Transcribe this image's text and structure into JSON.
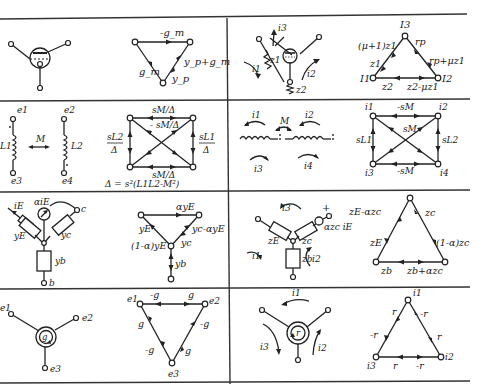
{
  "table": {
    "rows": 4,
    "columns": 2,
    "cells": [
      {
        "id": "r1c1",
        "element": "vacuum tube (triode)",
        "graph_labels": {
          "top": "-g_m",
          "right": "y_p+g_m",
          "right_lower": "y_p",
          "left": "g_m"
        }
      },
      {
        "id": "r1c2",
        "element": "vacuum tube with impedances",
        "circuit_labels": {
          "i3": "i3",
          "i1": "i1",
          "i2": "i2",
          "z1": "z1",
          "z2": "z2"
        },
        "graph_labels": {
          "top_node": "I3",
          "left_node": "I1",
          "right_node": "I2",
          "left_upper": "(μ+1)z1",
          "left_lower": "z1",
          "right_upper": "rp",
          "right_lower": "rp+μz1",
          "bottom_left": "z2",
          "bottom_right": "z2-μz1"
        }
      },
      {
        "id": "r2c1",
        "element": "coupled inductors (nodal)",
        "circuit_labels": {
          "e1": "e1",
          "e2": "e2",
          "e3": "e3",
          "e4": "e4",
          "L1": "L1",
          "L2": "L2",
          "M": "M"
        },
        "graph_labels": {
          "top": "sM/Δ",
          "center": "sM/Δ",
          "bottom": "sM/Δ",
          "left_num": "sL2",
          "left_den": "Δ",
          "right_num": "sL1",
          "right_den": "Δ",
          "center_sign": "-",
          "formula": "Δ = s²(L1L2-M²)"
        }
      },
      {
        "id": "r2c2",
        "element": "coupled inductors (mesh)",
        "circuit_labels": {
          "i1": "i1",
          "i2": "i2",
          "i3": "i3",
          "i4": "i4",
          "M": "M"
        },
        "graph_labels": {
          "n1": "i1",
          "n2": "i2",
          "n3": "i3",
          "n4": "i4",
          "top": "-sM",
          "center": "sM",
          "bottom": "-sM",
          "left": "sL1",
          "right": "sL2"
        }
      },
      {
        "id": "r3c1",
        "element": "transistor (admittance model)",
        "circuit_labels": {
          "iE": "iE",
          "source": "αiE",
          "c": "c",
          "b": "b",
          "yE": "yE",
          "yc": "yc",
          "yb": "yb"
        },
        "graph_labels": {
          "top": "αyE",
          "left": "yE",
          "left_lower": "(1-α)yE",
          "right_upper": "yc-αyE",
          "right_lower": "yc",
          "vertical": "yb"
        }
      },
      {
        "id": "r3c2",
        "element": "transistor (impedance model)",
        "circuit_labels": {
          "i1": "i1",
          "i2": "i2",
          "i3": "i3",
          "zE": "zE",
          "zc": "zc",
          "zb": "zb",
          "source": "αzc iE",
          "plus": "+"
        },
        "graph_labels": {
          "left_upper": "zE-αzc",
          "left_lower": "zE",
          "right_upper": "zc",
          "right_lower": "(1-α)zc",
          "bottom_left": "zb",
          "bottom_right": "zb+αzc"
        }
      },
      {
        "id": "r4c1",
        "element": "gyrator (conductance)",
        "circuit_labels": {
          "e1": "e1",
          "e2": "e2",
          "e3": "e3",
          "g": "g"
        },
        "graph_labels": {
          "n1": "e1",
          "n2": "e2",
          "n3": "e3",
          "top_left": "-g",
          "top_right": "g",
          "left_upper": "g",
          "left_lower": "-g",
          "right_upper": "-g",
          "right_lower": "g"
        }
      },
      {
        "id": "r4c2",
        "element": "gyrator (resistance)",
        "circuit_labels": {
          "i1": "i1",
          "i2": "i2",
          "i3": "i3",
          "r": "r"
        },
        "graph_labels": {
          "n1": "i1",
          "n2": "i2",
          "n3": "i3",
          "left_upper": "r",
          "left_lower": "-r",
          "right_upper": "-r",
          "right_lower": "r",
          "bottom_left": "r",
          "bottom_right": "-r"
        }
      }
    ]
  }
}
